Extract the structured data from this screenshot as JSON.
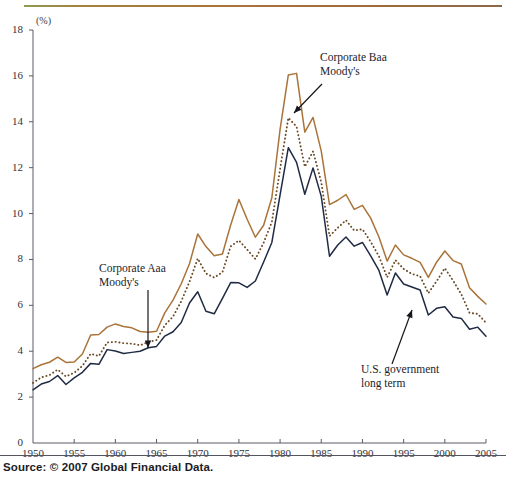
{
  "figure": {
    "unit_label": "(%)",
    "source": "Source: © 2007 Global Financial Data.",
    "rule_color": "#a9733a"
  },
  "annotations": {
    "baa": {
      "line1": "Corporate Baa",
      "line2": "Moody's"
    },
    "aaa": {
      "line1": "Corporate Aaa",
      "line2": "Moody's"
    },
    "gov": {
      "line1": "U.S. government",
      "line2": "long term"
    }
  },
  "chart_data": {
    "type": "line",
    "title": "",
    "xlabel": "",
    "ylabel": "(%)",
    "xlim": [
      1950,
      2005
    ],
    "ylim": [
      0,
      18
    ],
    "xticks": [
      1950,
      1955,
      1960,
      1965,
      1970,
      1975,
      1980,
      1985,
      1990,
      1995,
      2000,
      2005
    ],
    "yticks": [
      0,
      2,
      4,
      6,
      8,
      10,
      12,
      14,
      16,
      18
    ],
    "grid": false,
    "legend": "annotations-on-plot",
    "x": [
      1950,
      1951,
      1952,
      1953,
      1954,
      1955,
      1956,
      1957,
      1958,
      1959,
      1960,
      1961,
      1962,
      1963,
      1964,
      1965,
      1966,
      1967,
      1968,
      1969,
      1970,
      1971,
      1972,
      1973,
      1974,
      1975,
      1976,
      1977,
      1978,
      1979,
      1980,
      1981,
      1982,
      1983,
      1984,
      1985,
      1986,
      1987,
      1988,
      1989,
      1990,
      1991,
      1992,
      1993,
      1994,
      1995,
      1996,
      1997,
      1998,
      1999,
      2000,
      2001,
      2002,
      2003,
      2004,
      2005
    ],
    "series": [
      {
        "name": "Corporate Baa Moody's",
        "color": "#a9733a",
        "style": "solid",
        "values": [
          3.24,
          3.41,
          3.52,
          3.74,
          3.51,
          3.53,
          3.88,
          4.71,
          4.73,
          5.05,
          5.19,
          5.08,
          5.02,
          4.86,
          4.83,
          4.87,
          5.67,
          6.23,
          6.94,
          7.81,
          9.11,
          8.56,
          8.16,
          8.24,
          9.5,
          10.61,
          9.75,
          8.97,
          9.49,
          10.69,
          13.67,
          16.04,
          16.11,
          13.55,
          14.19,
          12.72,
          10.39,
          10.58,
          10.83,
          10.18,
          10.36,
          9.8,
          8.98,
          7.93,
          8.63,
          8.2,
          8.05,
          7.87,
          7.22,
          7.88,
          8.37,
          7.95,
          7.8,
          6.77,
          6.39,
          6.06
        ]
      },
      {
        "name": "Corporate Aaa Moody's",
        "color": "#6b4a26",
        "style": "dotted",
        "values": [
          2.62,
          2.86,
          2.96,
          3.2,
          2.9,
          3.06,
          3.36,
          3.89,
          3.79,
          4.38,
          4.41,
          4.35,
          4.33,
          4.26,
          4.4,
          4.49,
          5.13,
          5.51,
          6.18,
          7.03,
          8.04,
          7.39,
          7.21,
          7.44,
          8.57,
          8.83,
          8.43,
          8.02,
          8.73,
          9.63,
          11.94,
          14.17,
          13.79,
          12.04,
          12.71,
          11.37,
          9.02,
          9.38,
          9.71,
          9.26,
          9.32,
          8.77,
          8.14,
          7.22,
          7.97,
          7.59,
          7.37,
          7.27,
          6.53,
          7.05,
          7.62,
          7.08,
          6.49,
          5.67,
          5.63,
          5.24
        ]
      },
      {
        "name": "U.S. government long term",
        "color": "#1f2a44",
        "style": "solid",
        "values": [
          2.32,
          2.57,
          2.68,
          2.94,
          2.55,
          2.84,
          3.08,
          3.47,
          3.43,
          4.07,
          4.01,
          3.9,
          3.95,
          4.0,
          4.15,
          4.21,
          4.66,
          4.85,
          5.25,
          6.1,
          6.59,
          5.74,
          5.63,
          6.3,
          6.99,
          6.98,
          6.78,
          7.06,
          7.89,
          8.74,
          10.81,
          12.87,
          12.23,
          10.84,
          11.99,
          10.75,
          8.14,
          8.63,
          8.98,
          8.58,
          8.74,
          8.16,
          7.52,
          6.45,
          7.41,
          6.93,
          6.8,
          6.67,
          5.58,
          5.87,
          5.94,
          5.49,
          5.43,
          4.96,
          5.05,
          4.65
        ]
      }
    ]
  }
}
